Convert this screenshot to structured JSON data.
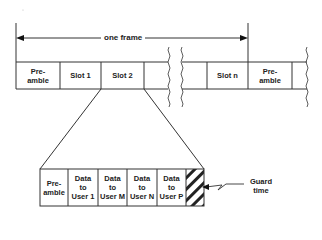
{
  "diagram": {
    "frame_label": "one frame",
    "top_row": {
      "cells": [
        {
          "label": "Pre-\namble"
        },
        {
          "label": "Slot 1"
        },
        {
          "label": "Slot 2"
        },
        {
          "label": ""
        },
        {
          "label": ""
        },
        {
          "label": "Slot n"
        },
        {
          "label": "Pre-\namble"
        },
        {
          "label": ""
        }
      ]
    },
    "bottom_row": {
      "cells": [
        {
          "label": "Pre-\namble"
        },
        {
          "label": "Data\nto\nUser 1"
        },
        {
          "label": "Data\nto\nUser M"
        },
        {
          "label": "Data\nto\nUser N"
        },
        {
          "label": "Data\nto\nUser P"
        },
        {
          "label": ""
        }
      ]
    },
    "guard_label": "Guard\ntime",
    "colors": {
      "line": "#333333",
      "background": "#ffffff"
    }
  }
}
